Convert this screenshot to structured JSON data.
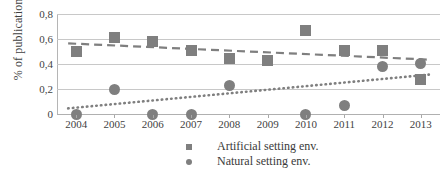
{
  "chart_data": {
    "type": "scatter",
    "title": "",
    "xlabel": "",
    "ylabel": "% of publications",
    "categories": [
      "2004",
      "2005",
      "2006",
      "2007",
      "2008",
      "2009",
      "2010",
      "2011",
      "2012",
      "2013"
    ],
    "x": [
      2004,
      2005,
      2006,
      2007,
      2008,
      2009,
      2010,
      2011,
      2012,
      2013
    ],
    "ylim": [
      0,
      0.8
    ],
    "xlim": [
      2003.5,
      2013.5
    ],
    "y_ticks": [
      0,
      0.2,
      0.4,
      0.6,
      0.8
    ],
    "y_tick_labels": [
      "0",
      "0,2",
      "0,4",
      "0,6",
      "0,8"
    ],
    "grid": true,
    "legend_position": "bottom",
    "decimal_separator": ",",
    "series": [
      {
        "name": "Artificial setting env.",
        "marker": "square",
        "color": "#7f7f7f",
        "values": [
          0.5,
          0.61,
          0.58,
          0.51,
          0.445,
          0.425,
          0.665,
          0.51,
          0.51,
          0.275
        ],
        "trendline": {
          "style": "dashed",
          "start": 0.565,
          "end": 0.435
        }
      },
      {
        "name": "Natural setting env.",
        "marker": "circle",
        "color": "#7f7f7f",
        "values": [
          0.0,
          0.2,
          0.0,
          0.0,
          0.225,
          null,
          0.0,
          0.07,
          0.38,
          0.405
        ],
        "trendline": {
          "style": "dotted",
          "start": 0.045,
          "end": 0.315
        }
      }
    ]
  },
  "axis": {
    "y_title": "% of publications"
  },
  "legend": {
    "items": [
      {
        "label": "Artificial setting env.",
        "marker": "square"
      },
      {
        "label": "Natural setting env.",
        "marker": "circle"
      }
    ]
  }
}
